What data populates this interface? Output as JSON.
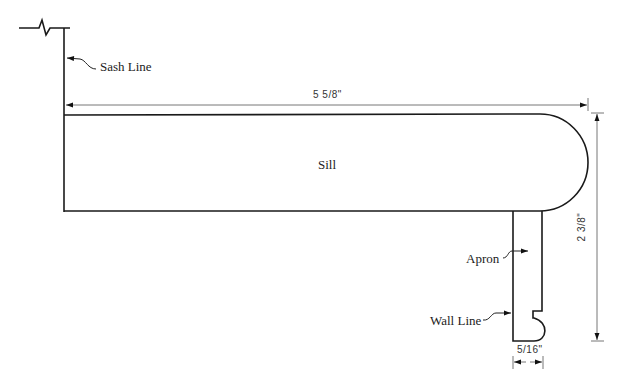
{
  "diagram": {
    "type": "window sill cross-section",
    "labels": {
      "sash_line": "Sash Line",
      "sill": "Sill",
      "apron": "Apron",
      "wall_line": "Wall Line"
    },
    "dimensions": {
      "sill_width": "5 5/8\"",
      "overall_height": "2 3/8\"",
      "apron_thickness": "5/16\""
    },
    "colors": {
      "outline": "#1a1a1a",
      "dimension_line": "#555555",
      "background": "#ffffff"
    }
  }
}
